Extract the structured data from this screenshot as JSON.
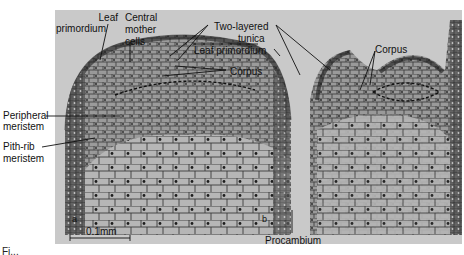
{
  "figure": {
    "labels": {
      "leaf_primordium_left": [
        "Leaf",
        "primordium"
      ],
      "central_mother_cells": [
        "Central",
        "mother",
        "cells"
      ],
      "two_layered_tunica": [
        "Two-layered",
        "tunica"
      ],
      "leaf_primordium_right": "Leaf primordium",
      "corpus_left": "Corpus",
      "corpus_right": "Corpus",
      "peripheral_meristem": [
        "Peripheral",
        "meristem"
      ],
      "pith_rib_meristem": [
        "Pith-rib",
        "meristem"
      ],
      "procambium": "Procambium"
    },
    "scale_bar": "0.1mm",
    "panel_markers": [
      "a",
      "b"
    ],
    "caption_fragment": "Fi..."
  },
  "colors": {
    "background": "#ffffff",
    "photo_background": "#c9c9c9",
    "tissue_dark": "#3a3a3a",
    "tissue_mid": "#8c8c8c",
    "label_text": "#111111",
    "leader_line": "#111111"
  }
}
